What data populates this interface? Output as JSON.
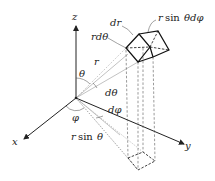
{
  "diagram": {
    "type": "spherical-coordinates-volume-element",
    "axes": {
      "x": "x",
      "y": "y",
      "z": "z"
    },
    "labels": {
      "theta": "θ",
      "phi": "φ",
      "r": "r",
      "d_theta": "dθ",
      "d_phi": "dφ",
      "dr": "dr",
      "r_d_theta": "rdθ",
      "r_sin_theta_prefix": "r",
      "r_sin_theta_func": "sin",
      "r_sin_theta_var": "θ",
      "r_sin_theta_d_phi_prefix": "r",
      "r_sin_theta_d_phi_func": "sin",
      "r_sin_theta_d_phi_var": "θdφ"
    },
    "colors": {
      "ink": "#222222",
      "guide": "#999999",
      "background": "#ffffff"
    }
  }
}
